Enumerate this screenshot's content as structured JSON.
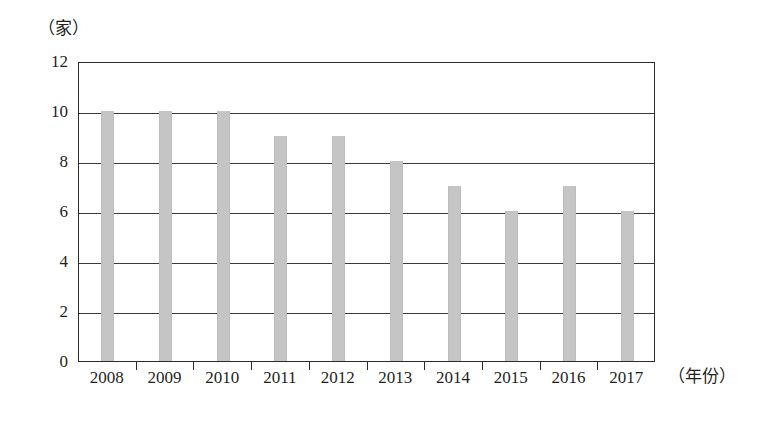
{
  "chart_data": {
    "type": "bar",
    "title": "",
    "subtitle": "",
    "xlabel": "（年份）",
    "ylabel": "（家）",
    "categories": [
      "2008",
      "2009",
      "2010",
      "2011",
      "2012",
      "2013",
      "2014",
      "2015",
      "2016",
      "2017"
    ],
    "values": [
      10,
      10,
      10,
      9,
      9,
      8,
      7,
      6,
      7,
      6
    ],
    "series": [
      {
        "name": "",
        "values": [
          10,
          10,
          10,
          9,
          9,
          8,
          7,
          6,
          7,
          6
        ]
      }
    ],
    "ylim": [
      0,
      12
    ],
    "ytick_labels": [
      "0",
      "2",
      "4",
      "6",
      "8",
      "10",
      "12"
    ],
    "ytick_values": [
      0,
      2,
      4,
      6,
      8,
      10,
      12
    ],
    "grid": true,
    "grid_axis": "y",
    "legend": false,
    "legend_position": "none",
    "bar_color": "#c5c5c5",
    "axis_color": "#2b2b2b",
    "background_color": "#ffffff",
    "annotations": []
  }
}
